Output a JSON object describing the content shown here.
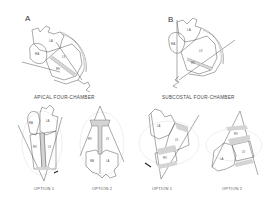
{
  "panels": {
    "a": {
      "letter": "A",
      "caption": "APICAL FOUR-CHAMBER",
      "chambers": {
        "ra": "RA",
        "la": "LA",
        "rv": "RV",
        "lv": "LV"
      },
      "options": [
        {
          "label": "OPTION 1",
          "chambers": {
            "ra": "RA",
            "la": "LA",
            "rv": "RV",
            "lv": "LV"
          }
        },
        {
          "label": "OPTION 2",
          "chambers": {
            "rv": "RV",
            "lv": "LV",
            "ra": "RA",
            "la": "LA"
          }
        }
      ]
    },
    "b": {
      "letter": "B",
      "caption": "SUBCOSTAL FOUR-CHAMBER",
      "chambers": {
        "ra": "RA",
        "la": "LA",
        "rv": "RV",
        "lv": "LV"
      },
      "options": [
        {
          "label": "OPTION 1",
          "chambers": {
            "la": "LA",
            "lv": "LV",
            "rv": "RV"
          }
        },
        {
          "label": "OPTION 2",
          "chambers": {
            "rv": "RV",
            "lv": "LV",
            "la": "LA"
          }
        }
      ]
    }
  },
  "colors": {
    "line": "#555555",
    "septum_fill": "#d4d4d4",
    "ghost_outline": "#cfcfcf",
    "background": "#ffffff"
  }
}
